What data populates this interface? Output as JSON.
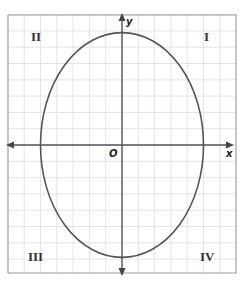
{
  "diagram": {
    "type": "coordinate-plane-ellipse",
    "frame": {
      "x": 8,
      "y": 15,
      "width": 228,
      "height": 258
    },
    "grid": {
      "unit_px": 16.3,
      "cols_left_of_origin": 7,
      "cols_right_of_origin": 7,
      "rows_above_origin": 8,
      "rows_below_origin": 8,
      "color": "#dddddd"
    },
    "origin": {
      "x": 122,
      "y": 145
    },
    "axes": {
      "color": "#555555",
      "x_label": "x",
      "y_label": "y",
      "origin_label": "O"
    },
    "ellipse": {
      "center": [
        0,
        0
      ],
      "semi_axis_x": 5,
      "semi_axis_y": 7,
      "equation": "x^2/25 + y^2/49 = 1",
      "stroke": "#555555"
    },
    "quadrants": [
      {
        "id": "I",
        "label": "I"
      },
      {
        "id": "II",
        "label": "II"
      },
      {
        "id": "III",
        "label": "III"
      },
      {
        "id": "IV",
        "label": "IV"
      }
    ],
    "frame_color": "#999999"
  }
}
